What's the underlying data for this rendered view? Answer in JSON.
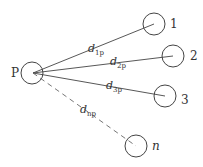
{
  "diagram": {
    "hub": {
      "label": "P",
      "cx": 32,
      "cy": 73,
      "r": 11,
      "label_x": 11,
      "label_y": 77
    },
    "nodes": [
      {
        "id": "1",
        "label": "1",
        "cx": 154,
        "cy": 24,
        "r": 11,
        "label_x": 170,
        "label_y": 28,
        "italic": false
      },
      {
        "id": "2",
        "label": "2",
        "cx": 173,
        "cy": 56,
        "r": 11,
        "label_x": 190,
        "label_y": 60,
        "italic": false
      },
      {
        "id": "3",
        "label": "3",
        "cx": 165,
        "cy": 96,
        "r": 11,
        "label_x": 181,
        "label_y": 104,
        "italic": false
      },
      {
        "id": "n",
        "label": "n",
        "cx": 136,
        "cy": 146,
        "r": 11,
        "label_x": 152,
        "label_y": 150,
        "italic": true
      }
    ],
    "edges": [
      {
        "from": "P",
        "to": "1",
        "x1": 33,
        "y1": 73,
        "x2": 154,
        "y2": 24,
        "dashed": false,
        "label_base": "d",
        "label_sub": "1p",
        "label_x": 88,
        "label_y": 52
      },
      {
        "from": "P",
        "to": "2",
        "x1": 33,
        "y1": 73,
        "x2": 173,
        "y2": 56,
        "dashed": false,
        "label_base": "d",
        "label_sub": "2p",
        "label_x": 110,
        "label_y": 65
      },
      {
        "from": "P",
        "to": "3",
        "x1": 33,
        "y1": 73,
        "x2": 165,
        "y2": 96,
        "dashed": false,
        "label_base": "d",
        "label_sub": "3p",
        "label_x": 106,
        "label_y": 89
      },
      {
        "from": "P",
        "to": "n",
        "x1": 33,
        "y1": 73,
        "x2": 136,
        "y2": 146,
        "dashed": true,
        "label_base": "d",
        "label_sub": "np",
        "label_x": 80,
        "label_y": 113
      }
    ]
  }
}
